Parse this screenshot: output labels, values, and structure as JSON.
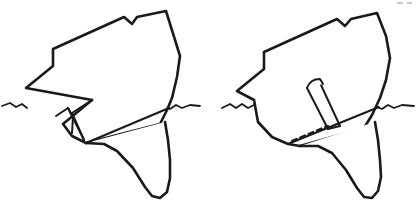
{
  "document": {
    "title": "Ship Bow Cross-Section Diagrams",
    "background_color": "#ffffff",
    "ink_color": "#1a1a1a",
    "width": 417,
    "height": 203
  },
  "figures": [
    {
      "id": "left-figure",
      "name": "bow-diagram-wedge",
      "caption": "",
      "elements": {
        "hull_outline": "M 92,100 L 26,88 L 53,66 L 53,49 L 124,17 L 132,24 L 137,17 L 166,11 L 180,56 L 177,77 L 172,98 L 167,110 L 160,124 L 86,143",
        "bulb_fin": "M 86,143 L 104,144 L 117,151 L 133,168 L 145,187 L 152,196 L 160,198 L 167,192 L 170,178 L 170,160 L 168,140 L 165,122",
        "bow_curve": "M 92,100 L 63,124 L 72,136 L 86,143",
        "diagonal_chord": "M 86,143 L 169,108",
        "wedge_outer": "M 92,100 L 72,113 L 84,140",
        "wedge_inner_triangle": "M 56,116 L 68,108 L 73,117 L 72,133",
        "wedge_tip": "M 68,108 L 84,140"
      },
      "internal_feature": "triangular-wedge",
      "waterline_left": "M 2,106 L 10,103 L 16,107 L 22,104 L 27,108",
      "waterline_right": "M 155,114 L 163,106 L 170,109 L 176,105 L 182,108 L 190,105 L 200,106"
    },
    {
      "id": "right-figure",
      "name": "bow-diagram-shaft",
      "caption": "",
      "elements": {
        "hull_outline": "M 254,100 L 237,91 L 264,69 L 264,52 L 337,19 L 345,26 L 351,19 L 377,13 L 386,36 L 390,58 L 386,80 L 380,98 L 372,115 L 364,128 L 300,146",
        "bulb_fin": "M 300,146 L 318,146 L 332,153 L 346,170 L 357,188 L 364,197 L 372,198 L 378,191 L 381,177 L 380,160 L 378,140 L 375,122",
        "bow_curve": "M 254,100 L 258,122 L 272,137 L 288,144 L 300,146",
        "diagonal_chord": "M 288,144 L 379,107",
        "shaft_outer": "M 307,88 L 328,129",
        "shaft_inner": "M 321,85 L 340,126",
        "shaft_cap_arc": "M 307,88 Q 310,79 320,79 L 323,84",
        "shaft_base": "M 328,129 L 340,126"
      },
      "internal_feature": "rectangular-shaft",
      "dashed_segment": "M 292,141 L 328,126",
      "waterline_left": "M 222,108 L 230,104 L 236,108 L 242,104 L 248,108 L 254,105",
      "waterline_right": "M 367,114 L 375,106 L 382,109 L 388,105 L 394,108 L 402,105 L 414,106"
    }
  ],
  "artifacts": {
    "corner_specks": [
      {
        "x": 397,
        "y": 2,
        "w": 6,
        "h": 2
      },
      {
        "x": 407,
        "y": 2,
        "w": 5,
        "h": 2
      }
    ]
  }
}
